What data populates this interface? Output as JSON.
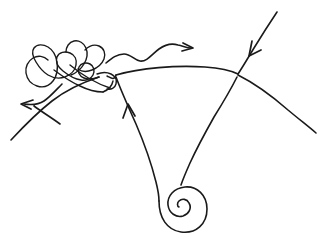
{
  "document": {
    "title": "Hand-drawn line sketch",
    "kind": "freehand-diagram",
    "background_color": "#ffffff",
    "ink_color": "#1a1a1a",
    "width": 323,
    "height": 246
  },
  "figure": {
    "stroke_color": "#1a1a1a",
    "stroke_width": 1.6
  },
  "elements": {
    "main_arc": {
      "name": "main-arc",
      "note": "Long gentle arc from lower-left tail, through left node, bowing over the top, through right node, down to lower-right edge.",
      "left_tail": "M 11,140 C 24,126 38,112 52,101 C 66,90 84,82 99,77",
      "center_span": "M 116,75 C 140,68 176,65 205,67 C 220,68 230,70 238,74",
      "right_tail": "M 238,75 C 254,83 272,96 288,110 C 300,120 309,127 316,133"
    },
    "left_node": {
      "name": "left-junction-node",
      "x": 116,
      "y": 75
    },
    "right_node": {
      "name": "right-junction-node",
      "x": 238,
      "y": 74
    },
    "left_leg": {
      "name": "left-leg",
      "note": "Descends from the left node down-right toward the spiral tail.",
      "path": "M 116,77 C 120,88 127,104 136,124 C 145,145 152,166 156,182 C 158,190 159,196 159,201"
    },
    "right_leg": {
      "name": "right-leg",
      "note": "Descends from the right node down-left toward the spiral.",
      "path": "M 237,77 C 232,87 224,101 214,117 C 205,133 196,150 190,163 C 186,172 183,179 181,185"
    },
    "spiral": {
      "name": "bottom-spiral",
      "note": "Tight inward clockwise spiral of about 2.5 turns at bottom center.",
      "center_x": 182,
      "center_y": 205,
      "turns": 2.6,
      "start_radius": 24,
      "path": "M 159,201 C 159,218 167,230 181,232 C 196,234 207,224 207,209 C 207,195 197,186 185,187 C 174,188 167,196 168,205 C 169,213 176,218 183,216 C 189,214 192,208 189,203 C 187,199 182,198 179,201 C 177,203 177,206 179,207"
    },
    "wavy_arrow_line": {
      "name": "wavy-arrow-line",
      "note": "Undulating squiggle above the arc running left to right, terminating in a rightward arrowhead.",
      "path": "M 106,63 C 112,58 117,54 124,54 C 131,54 134,60 140,61 C 147,62 152,54 159,49 C 166,44 172,43 178,45 C 183,46 187,48 191,48",
      "arrow_tip_x": 193,
      "arrow_tip_y": 48,
      "arrowhead": "M 183,43 L 193,48 L 182,51"
    },
    "incoming_arrow_line": {
      "name": "incoming-arrow-line",
      "note": "Straight line entering from the top right corner, descending to the right node, with an arrowhead partway down pointing down-left.",
      "path": "M 277,12 C 271,21 262,35 254,48 C 248,58 242,68 238,74",
      "arrowhead": "M 252,41 L 249,56 L 261,50"
    },
    "left_arrowhead": {
      "name": "left-pointing-arrowhead",
      "note": "Arrowhead on the lower-left branch pointing up-left.",
      "tip_x": 21,
      "tip_y": 103,
      "path": "M 33,100 L 21,104 L 31,109"
    },
    "up_arrowhead": {
      "name": "up-pointing-arrowhead",
      "note": "Arrowhead on the left leg pointing up toward the left node.",
      "tip_x": 128,
      "tip_y": 104,
      "path": "M 123,118 L 128,104 L 135,116"
    },
    "left_branch": {
      "name": "left-branch-curve",
      "note": "Curve leaving the scribble knot down-left toward the arrowhead, then continuing to the lower-left edge.",
      "path": "M 62,84 C 56,90 50,97 44,101 C 38,105 31,105 24,104 M 34,106 C 42,112 52,118 60,124"
    },
    "scribble": {
      "name": "tangled-scribble-knot",
      "note": "Dense hand-drawn tangle of overlapping loops at the upper left, merging into the left end of the arc.",
      "strokes": [
        "M 99,77 C 94,79 89,80 84,78 C 79,76 77,71 79,67 C 81,63 86,62 90,64 C 94,66 95,71 93,75 C 91,79 86,81 81,80 C 74,79 68,75 63,71 C 58,67 55,62 57,57 C 59,52 65,51 70,53 C 75,55 77,60 76,65 C 75,71 70,75 65,77 C 59,79 53,78 48,75 C 43,72 39,67 36,62 C 33,57 31,52 34,48 C 37,44 43,44 48,47 C 53,50 56,56 57,62",
        "M 57,62 C 58,69 57,76 53,81 C 49,86 43,88 37,86 C 31,84 27,79 26,73 C 25,67 28,61 33,58 C 38,55 44,56 48,60",
        "M 66,52 C 66,47 69,42 74,41 C 79,40 84,43 86,48 C 88,53 87,59 84,64 C 81,69 76,73 71,75",
        "M 85,50 C 89,46 94,44 99,46 C 104,48 106,54 104,59 C 102,64 97,68 92,70 C 87,72 82,72 78,69",
        "M 70,65 C 76,70 83,75 90,79 C 97,83 104,86 110,88",
        "M 54,70 C 62,76 71,82 80,86 C 88,90 96,92 103,92",
        "M 97,74 C 102,72 107,72 111,74 C 115,76 117,80 116,84 C 115,88 111,90 107,89",
        "M 103,92 C 108,90 112,86 113,81",
        "M 107,76 C 111,78 114,81 116,75"
      ]
    }
  }
}
